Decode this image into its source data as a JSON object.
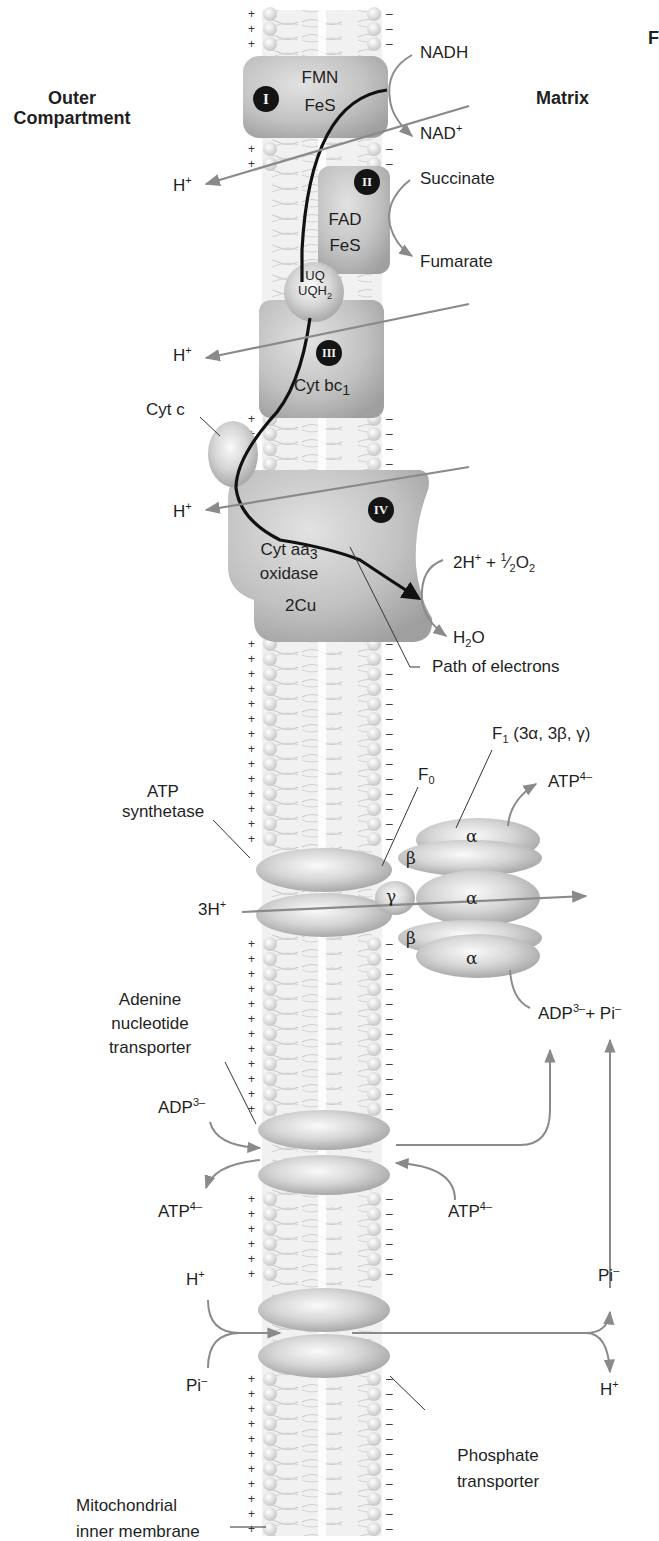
{
  "regions": {
    "outer": "Outer\nCompartment",
    "outer_line1": "Outer",
    "outer_line2": "Compartment",
    "matrix": "Matrix",
    "edge_fragment": "F"
  },
  "complexes": {
    "I": {
      "numeral": "I",
      "lines": [
        "FMN",
        "FeS"
      ]
    },
    "II": {
      "numeral": "II",
      "lines": [
        "FAD",
        "FeS"
      ]
    },
    "ubiquinone": {
      "lines": [
        "UQ",
        "UQH2"
      ],
      "line1": "UQ",
      "line2_base": "UQH",
      "line2_sub": "2"
    },
    "III": {
      "numeral": "III",
      "line_base": "Cyt bc",
      "line_sub": "1"
    },
    "cytc": {
      "label": "Cyt c"
    },
    "IV": {
      "numeral": "IV",
      "line1_base": "Cyt aa",
      "line1_sub": "3",
      "line2": "oxidase",
      "line3": "2Cu"
    }
  },
  "reactions": {
    "nadh": "NADH",
    "nad_base": "NAD",
    "nad_sup": "+",
    "succinate": "Succinate",
    "fumarate": "Fumarate",
    "o2_left": "2H",
    "o2_sup": "+",
    "o2_mid": " + ",
    "o2_frac_num": "1",
    "o2_frac_den": "2",
    "o2_base": "O",
    "o2_sub": "2",
    "h2o_h": "H",
    "h2o_sub": "2",
    "h2o_o": "O",
    "path_of_electrons": "Path of electrons"
  },
  "protons": {
    "h": "H",
    "plus": "+",
    "three_h": "3H"
  },
  "atp_synthase": {
    "label_line1": "ATP",
    "label_line2": "synthetase",
    "f0_base": "F",
    "f0_sub": "0",
    "f1_base": "F",
    "f1_sub": "1",
    "f1_rest": " (3α, 3β, γ)",
    "alpha": "α",
    "beta": "β",
    "gamma": "γ",
    "atp_base": "ATP",
    "atp_sup": "4–",
    "adp_base": "ADP",
    "adp_sup": "3–",
    "adp_plus": "+ Pi",
    "pi_sup": "–"
  },
  "ant": {
    "label_lines": [
      "Adenine",
      "nucleotide",
      "transporter"
    ],
    "adp_base": "ADP",
    "adp_sup": "3–",
    "atp_base": "ATP",
    "atp_sup": "4–"
  },
  "phosphate": {
    "h_base": "H",
    "h_sup": "+",
    "pi_base": "Pi",
    "pi_sup": "–",
    "label_lines": [
      "Phosphate",
      "transporter"
    ]
  },
  "membrane": {
    "label_line1": "Mitochondrial",
    "label_line2": "inner membrane",
    "plus": "+",
    "minus": "–"
  },
  "colors": {
    "protein": "#bdbdbd",
    "protein_dark": "#a8a8a8",
    "lipid_head": "#e4e4e4",
    "arrow_gray": "#8a8a8a",
    "electron_path": "#111111",
    "badge": "#141414"
  }
}
